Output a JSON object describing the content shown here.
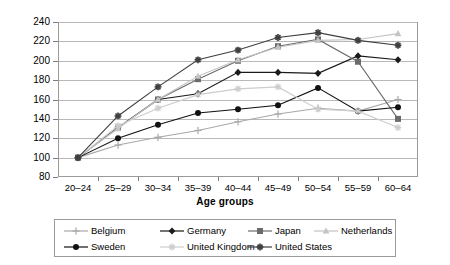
{
  "chart_data": {
    "type": "line",
    "title": "",
    "subtitle": "",
    "xlabel": "Age groups",
    "ylabel": "",
    "categories": [
      "20–24",
      "25–29",
      "30–34",
      "35–39",
      "40–44",
      "45–49",
      "50–54",
      "55–59",
      "60–64"
    ],
    "ylim": [
      80,
      240
    ],
    "ytick_values": [
      240,
      220,
      200,
      180,
      160,
      140,
      120,
      100,
      80
    ],
    "ytick_labels": [
      "240",
      "220",
      "200",
      "180",
      "160",
      "140",
      "120",
      "100",
      "80"
    ],
    "grid": "horizontal",
    "legend_position": "bottom",
    "series": [
      {
        "name": "Belgium",
        "color": "#a8a8a8",
        "marker": "plus",
        "values": [
          100,
          113,
          121,
          128,
          137,
          145,
          151,
          148,
          160
        ]
      },
      {
        "name": "Germany",
        "color": "#1a1a1a",
        "marker": "diamond",
        "values": [
          100,
          131,
          160,
          166,
          188,
          188,
          187,
          205,
          201
        ]
      },
      {
        "name": "Japan",
        "color": "#6b6b6b",
        "marker": "square",
        "values": [
          100,
          131,
          160,
          181,
          200,
          215,
          222,
          199,
          140
        ]
      },
      {
        "name": "Netherlands",
        "color": "#c4c4c4",
        "marker": "triangle",
        "values": [
          100,
          130,
          160,
          184,
          201,
          214,
          221,
          222,
          228
        ]
      },
      {
        "name": "Sweden",
        "color": "#111111",
        "marker": "circle",
        "values": [
          100,
          120,
          134,
          146,
          150,
          154,
          172,
          148,
          152
        ]
      },
      {
        "name": "United Kingdom",
        "color": "#cdcdcd",
        "marker": "star",
        "values": [
          100,
          133,
          151,
          165,
          171,
          173,
          150,
          148,
          131
        ]
      },
      {
        "name": "United States",
        "color": "#3f3f3f",
        "marker": "cross",
        "values": [
          100,
          143,
          173,
          201,
          211,
          224,
          229,
          221,
          216
        ]
      }
    ]
  },
  "legend": {
    "items": [
      {
        "label": "Belgium"
      },
      {
        "label": "Germany"
      },
      {
        "label": "Japan"
      },
      {
        "label": "Netherlands"
      },
      {
        "label": "Sweden"
      },
      {
        "label": "United Kingdom"
      },
      {
        "label": "United States"
      }
    ]
  }
}
